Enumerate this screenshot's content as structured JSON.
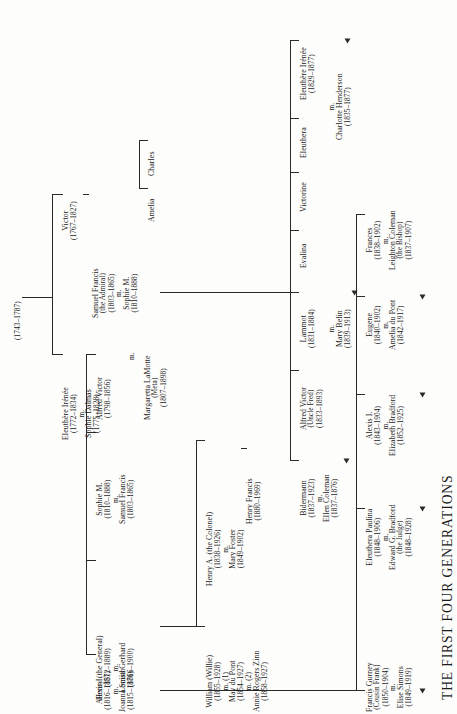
{
  "title": "THE FIRST FOUR GENERATIONS",
  "orientation": "rotated-90-ccw",
  "root": {
    "years": "(1743–1787)"
  },
  "generation2": {
    "victor": {
      "name": "Victor",
      "years": "(1767–1827)"
    },
    "eleuthere": {
      "name": "Eleuthère Irénée",
      "years": "(1772–1834)",
      "m": "m.",
      "spouse": "Sophie Dalmas",
      "spouse_years": "(1775–1828)"
    }
  },
  "generation3": {
    "samuel_francis_admiral": {
      "name": "Samuel Francis",
      "title": "(the Admiral)",
      "years": "(1803–1865)",
      "m": "m.",
      "spouse": "Sophie M.",
      "spouse_years": "(1810–1888)"
    },
    "victorine": {
      "name": "Victorine"
    },
    "evelina": {
      "name": "Evalina"
    },
    "alfred_victor": {
      "name": "Alfred Victor",
      "years": "(1798–1856)",
      "m": "m.",
      "spouse": "Margaretta LaMotte",
      "spouse_nick": "(Meta)",
      "spouse_years": "(1807–1898)"
    },
    "eleuthera": {
      "name": "Eleuthera"
    },
    "sophie_m": {
      "name": "Sophie M.",
      "years": "(1810–1888)",
      "m": "m.",
      "spouse": "Samuel Francis",
      "spouse_years": "(1803–1865)"
    },
    "henry_general": {
      "name": "Henry (the General)",
      "years": "(1812–1889)",
      "m": "m.",
      "spouse": "Louisa Gerhard",
      "spouse_years": "(1816–1900)"
    },
    "alexis_i": {
      "name": "Alexis I.",
      "years": "(1816–1857)",
      "m": "m.",
      "spouse": "Joanna Smith",
      "spouse_years": "(1815–1876)"
    }
  },
  "generation4": {
    "amelia": {
      "name": "Amelia"
    },
    "charles": {
      "name": "Charles"
    },
    "eleuthere_irenee": {
      "name": "Eleuthère Irénée",
      "years": "(1829–1877)",
      "m": "m.",
      "spouse": "Charlotte Henderson",
      "spouse_years": "(1835–1877)"
    },
    "lammot": {
      "name": "Lammot",
      "years": "(1831–1884)",
      "m": "m.",
      "spouse": "Mary Belin",
      "spouse_years": "(1839–1913)"
    },
    "alfred_victor_uncle_fred": {
      "name": "Alfred Victor",
      "title": "(Uncle Fred)",
      "years": "(1833–1893)"
    },
    "bidermann": {
      "name": "Bidermann",
      "years": "(1837–1923)",
      "m": "m.",
      "spouse": "Ellen Coleman",
      "spouse_years": "(1837–1876)"
    },
    "frances": {
      "name": "Frances",
      "years": "(1838–1902)",
      "m": "m.",
      "spouse": "Leighton Coleman",
      "spouse_title": "(the Bishop)",
      "spouse_years": "(1837–1907)"
    },
    "eugene": {
      "name": "Eugene",
      "years": "(1840–1902)",
      "m": "m.",
      "spouse": "Amelia du Pont",
      "spouse_years": "(1842–1917)"
    },
    "alexis_i_4": {
      "name": "Alexis I.",
      "years": "(1843–1904)",
      "m": "m.",
      "spouse": "Elizabeth Bradford",
      "spouse_years": "(1852–1925)"
    },
    "eleuthera_paulina": {
      "name": "Eleuthera Paulina",
      "years": "(1848–1906)",
      "m": "m.",
      "spouse": "Edward G. Bradford",
      "spouse_title": "(the Judge)",
      "spouse_years": "(1848–1928)"
    },
    "francis_gurney": {
      "name": "Francis Gurney",
      "title": "(Cousin Frank)",
      "years": "(1850–1904)",
      "m": "m.",
      "spouse": "Elise Simons",
      "spouse_years": "(1849–1919)"
    },
    "william_willie": {
      "name": "William (Willie)",
      "years": "(1855–1928)",
      "m1": "m. (1)",
      "spouse1": "May du Pont",
      "spouse1_years": "(1854–1927)",
      "m2": "m. (2)",
      "spouse2": "Annie Rogers Zinn",
      "spouse2_years": "(1858–1927)"
    },
    "henry_a_colonel": {
      "name": "Henry A. (the Colonel)",
      "years": "(1838–1926)",
      "m": "m.",
      "spouse": "Mary Foster",
      "spouse_years": "(1849–1902)"
    },
    "henry_francis": {
      "name": "Henry Francis",
      "years": "(1880–1969)"
    }
  },
  "colors": {
    "ink": "#1b1b1b",
    "rule": "#2a2a2a",
    "paper": "#fdfdfb"
  }
}
